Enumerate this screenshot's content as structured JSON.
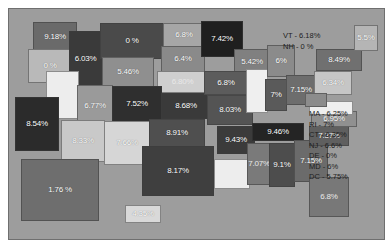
{
  "figure": {
    "background_color": "#9d9d9d",
    "border_color": "#6f6f6f"
  },
  "annotations": {
    "northeast": {
      "name": "vt-nh-callout",
      "lines": [
        "VT - 6.18%",
        "NH - 0 %"
      ]
    },
    "east_coast": {
      "name": "small-states-callout",
      "lines": [
        "MA - 6.25%",
        "RI - 7%",
        "CT - 6.35%",
        "NJ - 6.6%",
        "DE - 0%",
        "MD - 6%",
        "DC - 5.75%"
      ]
    }
  },
  "chart_data": {
    "type": "map",
    "value_unit": "percent",
    "value_label_suffix": "%",
    "regions": [
      {
        "code": "WA",
        "label": "9.18%",
        "value": 9.18,
        "fill": "#6a6a6a",
        "text": "light",
        "x": 24,
        "y": 13,
        "w": 44,
        "h": 30
      },
      {
        "code": "OR",
        "label": "0 %",
        "value": 0.0,
        "fill": "#b9b9b9",
        "text": "light",
        "x": 19,
        "y": 40,
        "w": 44,
        "h": 34
      },
      {
        "code": "ID",
        "label": "6.03%",
        "value": 6.03,
        "fill": "#3a3a3a",
        "text": "light",
        "x": 60,
        "y": 22,
        "w": 33,
        "h": 56
      },
      {
        "code": "MT",
        "label": "0 %",
        "value": 0.0,
        "fill": "#4a4a4a",
        "text": "light",
        "x": 91,
        "y": 14,
        "w": 64,
        "h": 36
      },
      {
        "code": "ND",
        "label": "6.8%",
        "value": 6.8,
        "fill": "#a6a6a6",
        "text": "light",
        "x": 154,
        "y": 14,
        "w": 42,
        "h": 24
      },
      {
        "code": "SD",
        "label": "6.4%",
        "value": 6.4,
        "fill": "#8a8a8a",
        "text": "light",
        "x": 152,
        "y": 37,
        "w": 44,
        "h": 26
      },
      {
        "code": "WY",
        "label": "5.46%",
        "value": 5.46,
        "fill": "#8f8f8f",
        "text": "light",
        "x": 93,
        "y": 48,
        "w": 52,
        "h": 30
      },
      {
        "code": "NE",
        "label": "6.80%",
        "value": 6.8,
        "fill": "#cfcfcf",
        "text": "mid",
        "x": 148,
        "y": 62,
        "w": 51,
        "h": 22
      },
      {
        "code": "NV",
        "label": "",
        "value": null,
        "fill": "#ededed",
        "text": "dark",
        "x": 37,
        "y": 62,
        "w": 33,
        "h": 48
      },
      {
        "code": "UT",
        "label": "6.77%",
        "value": 6.77,
        "fill": "#9a9a9a",
        "text": "light",
        "x": 68,
        "y": 76,
        "w": 36,
        "h": 42
      },
      {
        "code": "CO",
        "label": "7.52%",
        "value": 7.52,
        "fill": "#2f2f2f",
        "text": "light",
        "x": 103,
        "y": 77,
        "w": 50,
        "h": 36
      },
      {
        "code": "KS",
        "label": "8.68%",
        "value": 8.68,
        "fill": "#3a3a3a",
        "text": "light",
        "x": 152,
        "y": 84,
        "w": 50,
        "h": 26
      },
      {
        "code": "CA",
        "label": "8.54%",
        "value": 8.54,
        "fill": "#2b2b2b",
        "text": "light",
        "x": 6,
        "y": 88,
        "w": 44,
        "h": 54
      },
      {
        "code": "AZ",
        "label": "8.33%",
        "value": 8.33,
        "fill": "#c9c9c9",
        "text": "light",
        "x": 52,
        "y": 111,
        "w": 44,
        "h": 42
      },
      {
        "code": "NM",
        "label": "7.66%",
        "value": 7.66,
        "fill": "#d6d6d6",
        "text": "light",
        "x": 95,
        "y": 112,
        "w": 46,
        "h": 44
      },
      {
        "code": "OK",
        "label": "8.91%",
        "value": 8.91,
        "fill": "#4f4f4f",
        "text": "light",
        "x": 140,
        "y": 110,
        "w": 56,
        "h": 28
      },
      {
        "code": "TX",
        "label": "8.17%",
        "value": 8.17,
        "fill": "#3f3f3f",
        "text": "light",
        "x": 133,
        "y": 137,
        "w": 72,
        "h": 50
      },
      {
        "code": "MN",
        "label": "7.42%",
        "value": 7.42,
        "fill": "#1f1f1f",
        "text": "light",
        "x": 192,
        "y": 12,
        "w": 42,
        "h": 36
      },
      {
        "code": "WI",
        "label": "5.42%",
        "value": 5.42,
        "fill": "#808080",
        "text": "light",
        "x": 225,
        "y": 40,
        "w": 36,
        "h": 26
      },
      {
        "code": "IA",
        "label": "6.8%",
        "value": 6.8,
        "fill": "#5c5c5c",
        "text": "light",
        "x": 195,
        "y": 62,
        "w": 44,
        "h": 24
      },
      {
        "code": "MO",
        "label": "8.03%",
        "value": 8.03,
        "fill": "#545454",
        "text": "light",
        "x": 198,
        "y": 86,
        "w": 46,
        "h": 30
      },
      {
        "code": "IL",
        "label": "",
        "value": null,
        "fill": "#efefef",
        "text": "dark",
        "x": 237,
        "y": 60,
        "w": 22,
        "h": 44
      },
      {
        "code": "MI",
        "label": "6%",
        "value": 6.0,
        "fill": "#8b8b8b",
        "text": "light",
        "x": 258,
        "y": 36,
        "w": 28,
        "h": 32
      },
      {
        "code": "IN",
        "label": "7%",
        "value": 7.0,
        "fill": "#5a5a5a",
        "text": "light",
        "x": 256,
        "y": 70,
        "w": 22,
        "h": 32
      },
      {
        "code": "OH",
        "label": "7.15%",
        "value": 7.15,
        "fill": "#6d6d6d",
        "text": "light",
        "x": 277,
        "y": 66,
        "w": 30,
        "h": 30
      },
      {
        "code": "PA",
        "label": "6.34%",
        "value": 6.34,
        "fill": "#c6c6c6",
        "text": "light",
        "x": 305,
        "y": 62,
        "w": 38,
        "h": 24
      },
      {
        "code": "NY",
        "label": "8.49%",
        "value": 8.49,
        "fill": "#707070",
        "text": "light",
        "x": 307,
        "y": 40,
        "w": 46,
        "h": 22
      },
      {
        "code": "ME",
        "label": "5.5%",
        "value": 5.5,
        "fill": "#b5b5b5",
        "text": "light",
        "x": 345,
        "y": 16,
        "w": 24,
        "h": 26
      },
      {
        "code": "AR",
        "label": "9.43%",
        "value": 9.43,
        "fill": "#3b3b3b",
        "text": "light",
        "x": 208,
        "y": 117,
        "w": 38,
        "h": 28
      },
      {
        "code": "LA",
        "label": "",
        "value": null,
        "fill": "#ededed",
        "text": "dark",
        "x": 205,
        "y": 150,
        "w": 36,
        "h": 30
      },
      {
        "code": "TN",
        "label": "9.46%",
        "value": 9.46,
        "fill": "#242424",
        "text": "light",
        "x": 243,
        "y": 114,
        "w": 52,
        "h": 18
      },
      {
        "code": "MS",
        "label": "7.07%",
        "value": 7.07,
        "fill": "#7a7a7a",
        "text": "mid",
        "x": 238,
        "y": 134,
        "w": 24,
        "h": 42
      },
      {
        "code": "AL",
        "label": "9.1%",
        "value": 9.1,
        "fill": "#4d4d4d",
        "text": "light",
        "x": 260,
        "y": 134,
        "w": 26,
        "h": 44
      },
      {
        "code": "GA",
        "label": "7.15%",
        "value": 7.15,
        "fill": "#6b6b6b",
        "text": "light",
        "x": 285,
        "y": 131,
        "w": 34,
        "h": 42
      },
      {
        "code": "FL",
        "label": "6.8%",
        "value": 6.8,
        "fill": "#787878",
        "text": "mid",
        "x": 300,
        "y": 168,
        "w": 40,
        "h": 40
      },
      {
        "code": "SC",
        "label": "7.37%",
        "value": 7.37,
        "fill": "#5f5f5f",
        "text": "light",
        "x": 300,
        "y": 117,
        "w": 40,
        "h": 20
      },
      {
        "code": "NC",
        "label": "6.95%",
        "value": 6.95,
        "fill": "#909090",
        "text": "light",
        "x": 302,
        "y": 102,
        "w": 46,
        "h": 16
      },
      {
        "code": "VA",
        "label": "",
        "value": null,
        "fill": "#efefef",
        "text": "dark",
        "x": 300,
        "y": 92,
        "w": 44,
        "h": 14
      },
      {
        "code": "WV",
        "label": "",
        "value": null,
        "fill": "#8c8c8c",
        "text": "mid",
        "x": 296,
        "y": 84,
        "w": 22,
        "h": 14
      },
      {
        "code": "AK",
        "label": "1.76 %",
        "value": 1.76,
        "fill": "#6e6e6e",
        "text": "light",
        "x": 12,
        "y": 150,
        "w": 78,
        "h": 62
      },
      {
        "code": "HI",
        "label": "4.35%",
        "value": 4.35,
        "fill": "#d9d9d9",
        "text": "light",
        "x": 116,
        "y": 196,
        "w": 36,
        "h": 18
      }
    ],
    "extra_labels": [
      {
        "code": "VT",
        "value": 6.18
      },
      {
        "code": "NH",
        "value": 0.0
      },
      {
        "code": "MA",
        "value": 6.25
      },
      {
        "code": "RI",
        "value": 7.0
      },
      {
        "code": "CT",
        "value": 6.35
      },
      {
        "code": "NJ",
        "value": 6.6
      },
      {
        "code": "DE",
        "value": 0.0
      },
      {
        "code": "MD",
        "value": 6.0
      },
      {
        "code": "DC",
        "value": 5.75
      }
    ]
  }
}
